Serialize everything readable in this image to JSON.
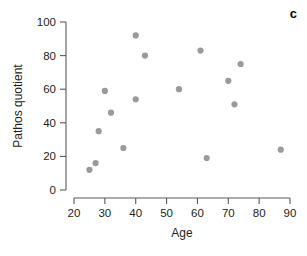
{
  "panel": {
    "label": "c"
  },
  "chart_data": {
    "type": "scatter",
    "title": "",
    "xlabel": "Age",
    "ylabel": "Pathos quotient",
    "xlim": [
      20,
      90
    ],
    "ylim": [
      0,
      100
    ],
    "xticks": [
      20,
      30,
      40,
      50,
      60,
      70,
      80,
      90
    ],
    "yticks": [
      0,
      20,
      40,
      60,
      80,
      100
    ],
    "xtick_labels": [
      "20",
      "30",
      "40",
      "50",
      "60",
      "70",
      "80",
      "90"
    ],
    "ytick_labels": [
      "0",
      "20",
      "40",
      "60",
      "80",
      "100"
    ],
    "grid": false,
    "legend": false,
    "point_color": "#9a9a9c",
    "axis_color": "#595959",
    "points": [
      {
        "x": 25,
        "y": 12
      },
      {
        "x": 27,
        "y": 16
      },
      {
        "x": 28,
        "y": 35
      },
      {
        "x": 30,
        "y": 59
      },
      {
        "x": 32,
        "y": 46
      },
      {
        "x": 36,
        "y": 25
      },
      {
        "x": 40,
        "y": 92
      },
      {
        "x": 40,
        "y": 54
      },
      {
        "x": 43,
        "y": 80
      },
      {
        "x": 54,
        "y": 60
      },
      {
        "x": 61,
        "y": 83
      },
      {
        "x": 63,
        "y": 19
      },
      {
        "x": 70,
        "y": 65
      },
      {
        "x": 72,
        "y": 51
      },
      {
        "x": 74,
        "y": 75
      },
      {
        "x": 87,
        "y": 24
      }
    ]
  }
}
